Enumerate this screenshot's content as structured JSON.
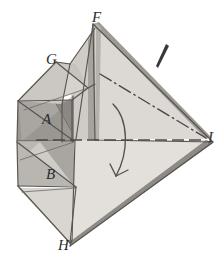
{
  "figure": {
    "background_color": "#ffffff",
    "ink_color": "#4a4744",
    "labels": [
      {
        "id": "label-F",
        "text": "F",
        "x": 92,
        "y": 10,
        "size": "sz-main"
      },
      {
        "id": "label-G",
        "text": "G",
        "x": 46,
        "y": 52,
        "size": "sz-main"
      },
      {
        "id": "label-A",
        "text": "A",
        "x": 42,
        "y": 112,
        "size": "sz-main"
      },
      {
        "id": "label-B",
        "text": "B",
        "x": 46,
        "y": 167,
        "size": "sz-main"
      },
      {
        "id": "label-H",
        "text": "H",
        "x": 58,
        "y": 238,
        "size": "sz-main"
      },
      {
        "id": "label-I",
        "text": "I",
        "x": 208,
        "y": 130,
        "size": "sz-main"
      }
    ],
    "faces": [
      {
        "id": "face-upper-right-large",
        "fill": "#dedad5",
        "name": "upper-right-large-face"
      },
      {
        "id": "face-lower-right-large",
        "fill": "#e2ded9",
        "name": "lower-right-large-face"
      },
      {
        "id": "face-upper-right-band",
        "fill": "#9d9a96",
        "name": "upper-right-edge-band"
      },
      {
        "id": "face-lower-right-band",
        "fill": "#8e8b87",
        "name": "lower-right-edge-band"
      },
      {
        "id": "face-A-dark",
        "fill": "#9a9793",
        "name": "face-A-shaded-triangle"
      },
      {
        "id": "face-B-dark",
        "fill": "#a8a5a1",
        "name": "face-B-shaded-triangle"
      },
      {
        "id": "face-G-upper",
        "fill": "#d6d2cd",
        "name": "face-G-upper-triangle"
      },
      {
        "id": "face-left-mid",
        "fill": "#cbc7c2",
        "name": "left-middle-triangle"
      },
      {
        "id": "face-left-lower",
        "fill": "#d2cec9",
        "name": "left-lower-triangle"
      },
      {
        "id": "face-bottom-left",
        "fill": "#d8d4cf",
        "name": "bottom-left-triangle"
      },
      {
        "id": "face-center-fold",
        "fill": "#cdc9c4",
        "name": "center-fold-sliver"
      },
      {
        "id": "face-center-fold-dark",
        "fill": "#a6a39f",
        "name": "center-fold-dark-sliver"
      }
    ],
    "annotations": {
      "fold_axis_label": "dash-dot axis F to I",
      "horizontal_axis_label": "dashed horizontal axis",
      "rotation_arrow_label": "curved rotation arrow",
      "tick_mark_label": "tapered tick mark"
    }
  }
}
